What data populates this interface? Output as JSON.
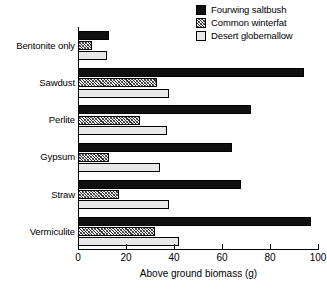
{
  "chart_data": {
    "type": "bar",
    "orientation": "horizontal",
    "title": "",
    "xlabel": "Above ground biomass (g)",
    "ylabel": "",
    "xlim": [
      0,
      100
    ],
    "xticks": [
      0,
      20,
      40,
      60,
      80,
      100
    ],
    "grid": false,
    "legend_position": "top-right",
    "categories": [
      "Bentonite only",
      "Sawdust",
      "Perlite",
      "Gypsum",
      "Straw",
      "Vermiculite"
    ],
    "series": [
      {
        "name": "Fourwing saltbush",
        "fill": "solid-black",
        "color": "#101010",
        "values": [
          13,
          94,
          72,
          64,
          68,
          97
        ]
      },
      {
        "name": "Common winterfat",
        "fill": "diagonal-hatch",
        "color": "#2b2b2b",
        "values": [
          6,
          33,
          26,
          13,
          17,
          32
        ]
      },
      {
        "name": "Desert globemallow",
        "fill": "light-gray",
        "color": "#e8e8e8",
        "values": [
          12,
          38,
          37,
          34,
          38,
          42
        ]
      }
    ]
  },
  "legend": {
    "items": [
      {
        "label": "Fourwing saltbush",
        "swatch": "fill-solid"
      },
      {
        "label": "Common winterfat",
        "swatch": "fill-hatch"
      },
      {
        "label": "Desert globemallow",
        "swatch": "fill-light"
      }
    ]
  },
  "axis": {
    "x_title": "Above ground biomass (g)",
    "x_tick_labels": [
      "0",
      "20",
      "40",
      "60",
      "80",
      "100"
    ]
  }
}
